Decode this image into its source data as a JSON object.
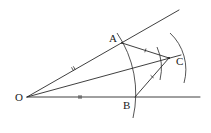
{
  "diagram": {
    "colors": {
      "stroke": "#2a2a2a",
      "label": "#1a1a1a",
      "background": "#ffffff"
    },
    "points": {
      "O": {
        "label": "O",
        "x": 27,
        "y": 97
      },
      "A": {
        "label": "A",
        "x": 122,
        "y": 43
      },
      "B": {
        "label": "B",
        "x": 135,
        "y": 97
      },
      "C": {
        "label": "C",
        "x": 169,
        "y": 58
      }
    },
    "rays": [
      {
        "name": "ray-OA",
        "from": "O",
        "to_xy": [
          179,
          10
        ]
      },
      {
        "name": "ray-OB",
        "from": "O",
        "to_xy": [
          200,
          97
        ]
      },
      {
        "name": "ray-OC",
        "from": "O",
        "to_xy": [
          181,
          55
        ]
      }
    ],
    "segments": [
      {
        "name": "segment-AC",
        "from": "A",
        "to": "C"
      },
      {
        "name": "segment-BC",
        "from": "B",
        "to": "C"
      }
    ],
    "arcs": [
      {
        "name": "arc-centre-O",
        "center": "O",
        "through": [
          "A",
          "B"
        ]
      },
      {
        "name": "arc-centre-A",
        "center": "A",
        "near": "C"
      },
      {
        "name": "arc-centre-B",
        "center": "B",
        "near": "C"
      }
    ],
    "tick_marks": [
      {
        "name": "tick-OA",
        "on": "OA",
        "count": 2
      },
      {
        "name": "tick-OB",
        "on": "OB",
        "count": 2
      },
      {
        "name": "tick-AC",
        "on": "AC",
        "count": 1
      },
      {
        "name": "tick-BC",
        "on": "BC",
        "count": 1
      }
    ],
    "labels": {
      "O": "O",
      "A": "A",
      "B": "B",
      "C": "C"
    }
  }
}
